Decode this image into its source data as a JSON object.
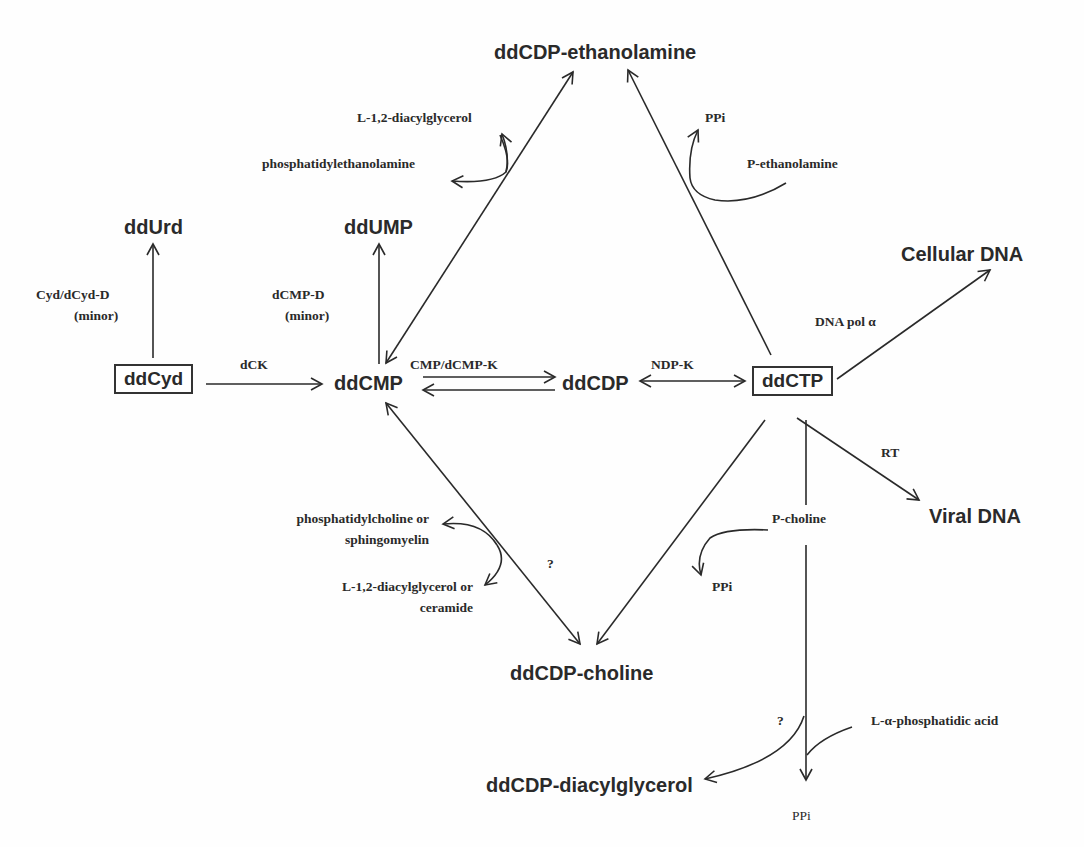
{
  "nodes": {
    "ddcdp_ethanolamine": "ddCDP-ethanolamine",
    "ddurd": "ddUrd",
    "ddump": "ddUMP",
    "ddcyd": "ddCyd",
    "ddcmp": "ddCMP",
    "ddcdp": "ddCDP",
    "ddctp": "ddCTP",
    "cellular_dna": "Cellular DNA",
    "viral_dna": "Viral DNA",
    "ddcdp_choline": "ddCDP-choline",
    "ddcdp_diacylglycerol": "ddCDP-diacylglycerol"
  },
  "labels": {
    "l12_diacylglycerol": "L-1,2-diacylglycerol",
    "phosphatidylethanolamine": "phosphatidylethanolamine",
    "ppi_top": "PPi",
    "p_ethanolamine": "P-ethanolamine",
    "cyd_dcyd_d": "Cyd/dCyd-D",
    "minor_1": "(minor)",
    "dcmp_d": "dCMP-D",
    "minor_2": "(minor)",
    "dck": "dCK",
    "cmp_dcmp_k": "CMP/dCMP-K",
    "ndp_k": "NDP-K",
    "dna_pol": "DNA pol α",
    "rt": "RT",
    "phosphatidylcholine_1": "phosphatidylcholine or",
    "phosphatidylcholine_2": "sphingomyelin",
    "l12_dag_ceramide_1": "L-1,2-diacylglycerol or",
    "l12_dag_ceramide_2": "ceramide",
    "question_1": "?",
    "p_choline": "P-choline",
    "ppi_mid": "PPi",
    "question_2": "?",
    "l_alpha_phosphatidic": "L-α-phosphatidic acid",
    "ppi_bottom": "PPi"
  },
  "colors": {
    "ink": "#2a2a2a",
    "background": "#fefefe"
  }
}
